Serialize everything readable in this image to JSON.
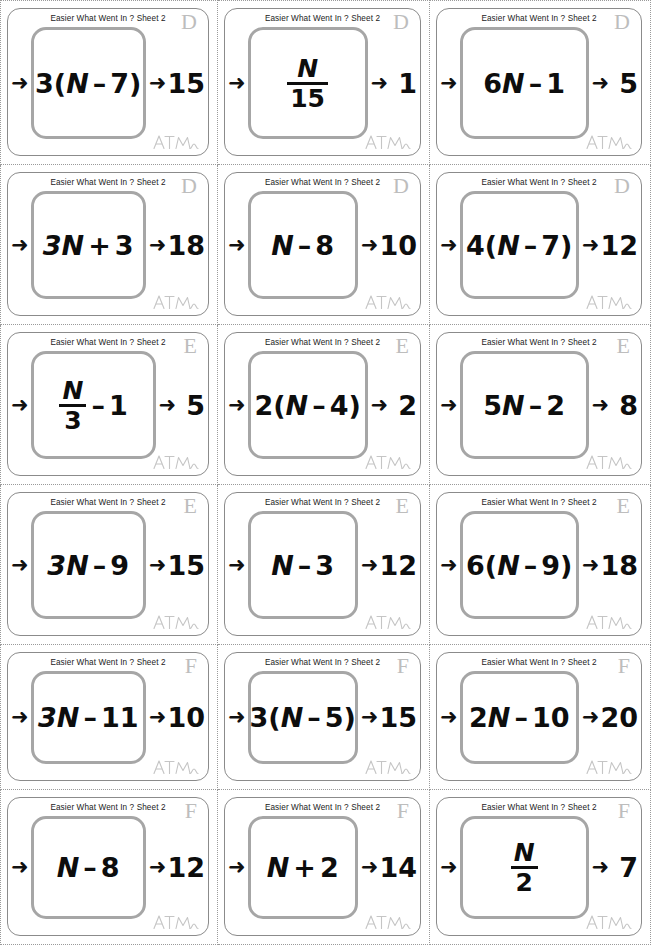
{
  "sheet": {
    "header_text": "Easier What Went In ? Sheet 2",
    "logo_name": "atm-logo",
    "arrow_glyph": "➜",
    "columns": 3,
    "rows": 6
  },
  "cards": [
    {
      "header": "Easier What Went In ? Sheet 2",
      "letter": "D",
      "expression": "3(N – 7)",
      "parts": [
        {
          "t": "3(",
          "i": false
        },
        {
          "t": "N",
          "i": true
        },
        {
          "t": "–",
          "i": false,
          "op": true
        },
        {
          "t": "7)",
          "i": false
        }
      ],
      "result": "15",
      "result_spaced": false,
      "logo": "ATM"
    },
    {
      "header": "Easier What Went In ? Sheet 2",
      "letter": "D",
      "expression": "N / 15",
      "fraction": {
        "num": "N",
        "den": "15"
      },
      "result": "1",
      "result_spaced": true,
      "logo": "ATM"
    },
    {
      "header": "Easier What Went In ? Sheet 2",
      "letter": "D",
      "expression": "6N – 1",
      "parts": [
        {
          "t": "6",
          "i": false
        },
        {
          "t": "N",
          "i": true
        },
        {
          "t": "–",
          "i": false,
          "op": true
        },
        {
          "t": "1",
          "i": false
        }
      ],
      "result": "5",
      "result_spaced": true,
      "logo": "ATM"
    },
    {
      "header": "Easier What Went In ? Sheet 2",
      "letter": "D",
      "expression": "3N + 3",
      "parts": [
        {
          "t": "3",
          "i": true
        },
        {
          "t": "N",
          "i": true
        },
        {
          "t": "+",
          "i": false,
          "op": true
        },
        {
          "t": "3",
          "i": false
        }
      ],
      "result": "18",
      "result_spaced": false,
      "logo": "ATM"
    },
    {
      "header": "Easier What Went In ? Sheet 2",
      "letter": "D",
      "expression": "N – 8",
      "parts": [
        {
          "t": "N",
          "i": true
        },
        {
          "t": "–",
          "i": false,
          "op": true
        },
        {
          "t": "8",
          "i": false
        }
      ],
      "result": "10",
      "result_spaced": false,
      "logo": "ATM"
    },
    {
      "header": "Easier What Went In ? Sheet 2",
      "letter": "D",
      "expression": "4(N – 7)",
      "parts": [
        {
          "t": "4(",
          "i": false
        },
        {
          "t": "N",
          "i": true
        },
        {
          "t": "–",
          "i": false,
          "op": true
        },
        {
          "t": "7)",
          "i": false
        }
      ],
      "result": "12",
      "result_spaced": false,
      "logo": "ATM"
    },
    {
      "header": "Easier What Went In ? Sheet 2",
      "letter": "E",
      "expression": "N / 3 – 1",
      "fraction": {
        "num": "N",
        "den": "3"
      },
      "after_fraction": [
        {
          "t": "–",
          "i": false,
          "op": true
        },
        {
          "t": "1",
          "i": false
        }
      ],
      "result": "5",
      "result_spaced": true,
      "logo": "ATM"
    },
    {
      "header": "Easier What Went In ? Sheet 2",
      "letter": "E",
      "expression": "2(N – 4)",
      "parts": [
        {
          "t": "2(",
          "i": false
        },
        {
          "t": "N",
          "i": true
        },
        {
          "t": "–",
          "i": false,
          "op": true
        },
        {
          "t": "4)",
          "i": false
        }
      ],
      "result": "2",
      "result_spaced": true,
      "logo": "ATM"
    },
    {
      "header": "Easier What Went In ? Sheet 2",
      "letter": "E",
      "expression": "5N – 2",
      "parts": [
        {
          "t": "5",
          "i": false
        },
        {
          "t": "N",
          "i": true
        },
        {
          "t": "–",
          "i": false,
          "op": true
        },
        {
          "t": "2",
          "i": false
        }
      ],
      "result": "8",
      "result_spaced": true,
      "logo": "ATM"
    },
    {
      "header": "Easier What Went In ? Sheet 2",
      "letter": "E",
      "expression": "3N – 9",
      "parts": [
        {
          "t": "3",
          "i": true
        },
        {
          "t": "N",
          "i": true
        },
        {
          "t": "–",
          "i": false,
          "op": true
        },
        {
          "t": "9",
          "i": false
        }
      ],
      "result": "15",
      "result_spaced": false,
      "logo": "ATM"
    },
    {
      "header": "Easier What Went In ? Sheet 2",
      "letter": "E",
      "expression": "N – 3",
      "parts": [
        {
          "t": "N",
          "i": true
        },
        {
          "t": "–",
          "i": false,
          "op": true
        },
        {
          "t": "3",
          "i": false
        }
      ],
      "result": "12",
      "result_spaced": false,
      "logo": "ATM"
    },
    {
      "header": "Easier What Went In ? Sheet 2",
      "letter": "E",
      "expression": "6(N – 9)",
      "parts": [
        {
          "t": "6(",
          "i": false
        },
        {
          "t": "N",
          "i": true
        },
        {
          "t": "–",
          "i": false,
          "op": true
        },
        {
          "t": "9)",
          "i": false
        }
      ],
      "result": "18",
      "result_spaced": false,
      "logo": "ATM"
    },
    {
      "header": "Easier What Went In ? Sheet 2",
      "letter": "F",
      "expression": "3N – 11",
      "parts": [
        {
          "t": "3",
          "i": true
        },
        {
          "t": "N",
          "i": true
        },
        {
          "t": "–",
          "i": false,
          "op": true
        },
        {
          "t": "11",
          "i": false
        }
      ],
      "result": "10",
      "result_spaced": false,
      "logo": "ATM"
    },
    {
      "header": "Easier What Went In ? Sheet 2",
      "letter": "F",
      "expression": "3(N – 5)",
      "parts": [
        {
          "t": "3(",
          "i": false
        },
        {
          "t": "N",
          "i": true
        },
        {
          "t": "–",
          "i": false,
          "op": true
        },
        {
          "t": "5)",
          "i": false
        }
      ],
      "result": "15",
      "result_spaced": false,
      "logo": "ATM"
    },
    {
      "header": "Easier What Went In ? Sheet 2",
      "letter": "F",
      "expression": "2N – 10",
      "parts": [
        {
          "t": "2",
          "i": false
        },
        {
          "t": "N",
          "i": true
        },
        {
          "t": "–",
          "i": false,
          "op": true
        },
        {
          "t": "10",
          "i": false
        }
      ],
      "result": "20",
      "result_spaced": false,
      "logo": "ATM"
    },
    {
      "header": "Easier What Went In ? Sheet 2",
      "letter": "F",
      "expression": "N – 8",
      "parts": [
        {
          "t": "N",
          "i": true
        },
        {
          "t": "–",
          "i": false,
          "op": true
        },
        {
          "t": "8",
          "i": false
        }
      ],
      "result": "12",
      "result_spaced": false,
      "logo": "ATM"
    },
    {
      "header": "Easier What Went In ? Sheet 2",
      "letter": "F",
      "expression": "N + 2",
      "parts": [
        {
          "t": "N",
          "i": true
        },
        {
          "t": "+",
          "i": false,
          "op": true
        },
        {
          "t": "2",
          "i": false
        }
      ],
      "result": "14",
      "result_spaced": false,
      "logo": "ATM"
    },
    {
      "header": "Easier What Went In ? Sheet 2",
      "letter": "F",
      "expression": "N / 2",
      "fraction": {
        "num": "N",
        "den": "2"
      },
      "result": "7",
      "result_spaced": true,
      "logo": "ATM"
    }
  ],
  "colors": {
    "card_border": "#8b8b8b",
    "machine_border": "#a6a6a6",
    "cut_line": "#9a9a9a",
    "corner_letter": "#bdbdbd",
    "text": "#0d0d0d"
  }
}
